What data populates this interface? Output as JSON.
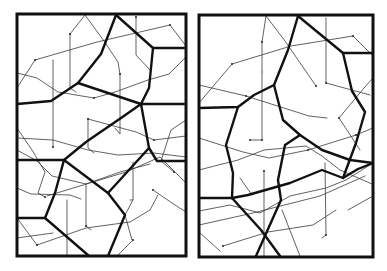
{
  "figure": {
    "colors": {
      "background": "#ffffff",
      "frame": "#111111",
      "thick_line": "#111111",
      "thin_line": "#3a3a3a"
    },
    "panels": [
      {
        "id": "left",
        "frame": {
          "x": 17,
          "y": 14,
          "w": 169,
          "h": 242
        },
        "thick": [
          [
            [
              116,
              15
            ],
            [
              101,
              54
            ],
            [
              78,
              83
            ],
            [
              51,
              101
            ],
            [
              17,
              104
            ]
          ],
          [
            [
              116,
              15
            ],
            [
              153,
              48
            ],
            [
              186,
              48
            ]
          ],
          [
            [
              153,
              48
            ],
            [
              149,
              88
            ],
            [
              141,
              104
            ],
            [
              186,
              104
            ]
          ],
          [
            [
              78,
              83
            ],
            [
              141,
              104
            ]
          ],
          [
            [
              141,
              104
            ],
            [
              149,
              148
            ],
            [
              157,
              161
            ],
            [
              186,
              161
            ]
          ],
          [
            [
              141,
              104
            ],
            [
              121,
              118
            ],
            [
              86,
              142
            ],
            [
              64,
              160
            ],
            [
              17,
              160
            ]
          ],
          [
            [
              64,
              160
            ],
            [
              55,
              193
            ],
            [
              45,
              218
            ],
            [
              17,
              218
            ]
          ],
          [
            [
              64,
              160
            ],
            [
              108,
              193
            ],
            [
              125,
              215
            ],
            [
              108,
              256
            ]
          ],
          [
            [
              149,
              148
            ],
            [
              108,
              193
            ]
          ],
          [
            [
              45,
              218
            ],
            [
              89,
              256
            ]
          ]
        ],
        "thin": [
          [
            [
              85,
              15
            ],
            [
              70,
              34
            ],
            [
              70,
              88
            ],
            [
              76,
              92
            ]
          ],
          [
            [
              85,
              15
            ],
            [
              104,
              41
            ],
            [
              118,
              62
            ],
            [
              120,
              74
            ]
          ],
          [
            [
              35,
              60
            ],
            [
              97,
              42
            ],
            [
              170,
              25
            ],
            [
              186,
              46
            ]
          ],
          [
            [
              35,
              60
            ],
            [
              17,
              88
            ]
          ],
          [
            [
              17,
              73
            ],
            [
              37,
              78
            ],
            [
              58,
              92
            ],
            [
              94,
              98
            ],
            [
              115,
              92
            ],
            [
              148,
              80
            ],
            [
              169,
              74
            ],
            [
              186,
              57
            ]
          ],
          [
            [
              136,
              17
            ],
            [
              136,
              55
            ],
            [
              150,
              70
            ]
          ],
          [
            [
              53,
              60
            ],
            [
              53,
              147
            ]
          ],
          [
            [
              120,
              74
            ],
            [
              120,
              134
            ],
            [
              115,
              128
            ]
          ],
          [
            [
              17,
              138
            ],
            [
              53,
              140
            ],
            [
              88,
              150
            ],
            [
              118,
              155
            ],
            [
              154,
              153
            ],
            [
              186,
              157
            ]
          ],
          [
            [
              88,
              119
            ],
            [
              88,
              148
            ],
            [
              94,
              153
            ]
          ],
          [
            [
              88,
              119
            ],
            [
              136,
              132
            ],
            [
              154,
              140
            ],
            [
              186,
              136
            ]
          ],
          [
            [
              186,
              120
            ],
            [
              171,
              130
            ],
            [
              161,
              161
            ],
            [
              174,
              172
            ]
          ],
          [
            [
              17,
              128
            ],
            [
              32,
              150
            ],
            [
              45,
              172
            ],
            [
              38,
              193
            ],
            [
              45,
              197
            ]
          ],
          [
            [
              17,
              150
            ],
            [
              37,
              161
            ],
            [
              52,
              176
            ],
            [
              86,
              184
            ],
            [
              120,
              172
            ],
            [
              150,
              164
            ]
          ],
          [
            [
              47,
              196
            ],
            [
              126,
              172
            ],
            [
              160,
              157
            ],
            [
              186,
              183
            ]
          ],
          [
            [
              17,
              188
            ],
            [
              31,
              194
            ],
            [
              70,
              195
            ],
            [
              81,
              199
            ]
          ],
          [
            [
              86,
              184
            ],
            [
              86,
              226
            ],
            [
              91,
              230
            ]
          ],
          [
            [
              133,
              162
            ],
            [
              133,
              200
            ],
            [
              130,
              200
            ]
          ],
          [
            [
              17,
              218
            ],
            [
              37,
              245
            ],
            [
              86,
              228
            ],
            [
              130,
              222
            ],
            [
              150,
              210
            ],
            [
              158,
              195
            ]
          ],
          [
            [
              133,
              200
            ],
            [
              125,
              215
            ],
            [
              132,
              240
            ],
            [
              133,
              240
            ],
            [
              117,
              256
            ]
          ],
          [
            [
              67,
              200
            ],
            [
              67,
              256
            ]
          ],
          [
            [
              17,
              238
            ],
            [
              53,
              233
            ]
          ],
          [
            [
              153,
              190
            ],
            [
              175,
              205
            ],
            [
              186,
              212
            ]
          ]
        ],
        "dots": [
          [
            70,
            34
          ],
          [
            35,
            60
          ],
          [
            170,
            25
          ],
          [
            136,
            17
          ],
          [
            120,
            74
          ],
          [
            94,
            98
          ],
          [
            88,
            119
          ],
          [
            53,
            147
          ],
          [
            154,
            140
          ],
          [
            174,
            172
          ],
          [
            45,
            197
          ],
          [
            86,
            226
          ],
          [
            133,
            240
          ],
          [
            37,
            245
          ],
          [
            153,
            190
          ]
        ]
      },
      {
        "id": "right",
        "frame": {
          "x": 199,
          "y": 15,
          "w": 174,
          "h": 242
        },
        "thick": [
          [
            [
              298,
              16
            ],
            [
              288,
              50
            ],
            [
              274,
              85
            ],
            [
              254,
              95
            ],
            [
              238,
              107
            ],
            [
              199,
              108
            ]
          ],
          [
            [
              298,
              16
            ],
            [
              343,
              53
            ],
            [
              373,
              53
            ]
          ],
          [
            [
              343,
              53
            ],
            [
              352,
              91
            ],
            [
              365,
              112
            ],
            [
              356,
              143
            ],
            [
              343,
              178
            ]
          ],
          [
            [
              274,
              85
            ],
            [
              283,
              120
            ],
            [
              300,
              135
            ],
            [
              322,
              150
            ],
            [
              350,
              160
            ],
            [
              373,
              163
            ]
          ],
          [
            [
              238,
              107
            ],
            [
              226,
              145
            ],
            [
              233,
              173
            ],
            [
              232,
              198
            ]
          ],
          [
            [
              232,
              198
            ],
            [
              248,
              195
            ],
            [
              290,
              183
            ],
            [
              322,
              170
            ],
            [
              343,
              178
            ],
            [
              358,
              169
            ],
            [
              373,
              163
            ]
          ],
          [
            [
              300,
              135
            ],
            [
              285,
              145
            ],
            [
              278,
              180
            ],
            [
              281,
              200
            ],
            [
              256,
              256
            ]
          ],
          [
            [
              232,
              198
            ],
            [
              261,
              230
            ],
            [
              280,
              256
            ]
          ],
          [
            [
              199,
              198
            ],
            [
              232,
              198
            ]
          ]
        ],
        "thin": [
          [
            [
              266,
              16
            ],
            [
              262,
              42
            ],
            [
              262,
              72
            ]
          ],
          [
            [
              266,
              16
            ],
            [
              285,
              41
            ],
            [
              316,
              86
            ]
          ],
          [
            [
              232,
              64
            ],
            [
              291,
              46
            ],
            [
              353,
              36
            ],
            [
              372,
              55
            ]
          ],
          [
            [
              232,
              64
            ],
            [
              199,
              103
            ]
          ],
          [
            [
              199,
              85
            ],
            [
              246,
              96
            ],
            [
              309,
              116
            ],
            [
              327,
              118
            ]
          ],
          [
            [
              326,
              18
            ],
            [
              326,
              83
            ],
            [
              370,
              95
            ]
          ],
          [
            [
              262,
              72
            ],
            [
              262,
              140
            ],
            [
              250,
              140
            ]
          ],
          [
            [
              199,
              138
            ],
            [
              243,
              152
            ],
            [
              269,
              158
            ],
            [
              308,
              150
            ],
            [
              356,
              135
            ],
            [
              373,
              128
            ]
          ],
          [
            [
              339,
              118
            ],
            [
              364,
              88
            ],
            [
              373,
              78
            ]
          ],
          [
            [
              339,
              118
            ],
            [
              360,
              150
            ]
          ],
          [
            [
              199,
              170
            ],
            [
              238,
              160
            ],
            [
              264,
              150
            ],
            [
              306,
              146
            ],
            [
              322,
              156
            ],
            [
              340,
              170
            ],
            [
              372,
              184
            ]
          ],
          [
            [
              264,
              171
            ],
            [
              264,
              256
            ]
          ],
          [
            [
              199,
              211
            ],
            [
              230,
              205
            ],
            [
              260,
              213
            ],
            [
              290,
              196
            ],
            [
              326,
              188
            ],
            [
              346,
              180
            ],
            [
              373,
              163
            ]
          ],
          [
            [
              199,
              225
            ],
            [
              253,
              213
            ],
            [
              320,
              196
            ],
            [
              365,
              176
            ]
          ],
          [
            [
              325,
              163
            ],
            [
              326,
              235
            ],
            [
              322,
              238
            ]
          ],
          [
            [
              223,
              246
            ],
            [
              268,
              232
            ],
            [
              313,
              225
            ],
            [
              336,
              210
            ]
          ],
          [
            [
              199,
              232
            ],
            [
              220,
              251
            ]
          ],
          [
            [
              282,
              210
            ],
            [
              300,
              256
            ]
          ],
          [
            [
              240,
              178
            ],
            [
              252,
              195
            ]
          ],
          [
            [
              348,
              210
            ],
            [
              373,
              196
            ]
          ]
        ],
        "dots": [
          [
            262,
            42
          ],
          [
            232,
            64
          ],
          [
            353,
            36
          ],
          [
            326,
            83
          ],
          [
            316,
            86
          ],
          [
            262,
            140
          ],
          [
            250,
            140
          ],
          [
            356,
            135
          ],
          [
            339,
            118
          ],
          [
            264,
            171
          ],
          [
            326,
            235
          ],
          [
            223,
            246
          ],
          [
            308,
            150
          ],
          [
            246,
            96
          ]
        ]
      }
    ]
  }
}
